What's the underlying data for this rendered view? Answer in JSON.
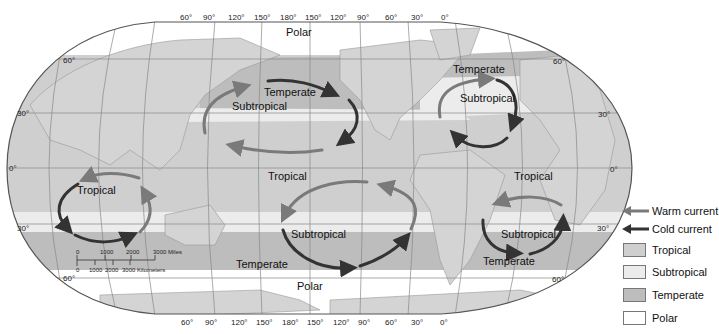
{
  "map": {
    "title": "Ocean circulation gyres and climate zones",
    "projection": "world map, Pacific-centered",
    "zone_labels": [
      {
        "id": "polar-north",
        "text": "Polar",
        "x": 327,
        "y": 11
      },
      {
        "id": "temperate-npac",
        "text": "Temperate",
        "x": 264,
        "y": 87
      },
      {
        "id": "subtropical-npac",
        "text": "Subtropical",
        "x": 232,
        "y": 101
      },
      {
        "id": "temperate-natl",
        "text": "Temperate",
        "x": 453,
        "y": 63
      },
      {
        "id": "subtropical-natl",
        "text": "Subtropical",
        "x": 459,
        "y": 92
      },
      {
        "id": "tropical-pac",
        "text": "Tropical",
        "x": 268,
        "y": 170
      },
      {
        "id": "tropical-atl",
        "text": "Tropical",
        "x": 514,
        "y": 170
      },
      {
        "id": "tropical-ind",
        "text": "Tropical",
        "x": 77,
        "y": 186
      },
      {
        "id": "subtropical-spac",
        "text": "Subtropical",
        "x": 291,
        "y": 232
      },
      {
        "id": "subtropical-satl",
        "text": "Subtropical",
        "x": 501,
        "y": 232
      },
      {
        "id": "temperate-spac",
        "text": "Temperate",
        "x": 236,
        "y": 258
      },
      {
        "id": "temperate-satl",
        "text": "Temperate",
        "x": 483,
        "y": 255
      },
      {
        "id": "polar-south",
        "text": "Polar",
        "x": 297,
        "y": 280
      }
    ],
    "lon_ticks_top": [
      "60°",
      "90°",
      "120°",
      "150°",
      "180°",
      "150°",
      "120°",
      "90°",
      "60°",
      "30°",
      "0°"
    ],
    "lon_ticks_bottom": [
      "60°",
      "90°",
      "120°",
      "150°",
      "180°",
      "150°",
      "120°",
      "90°",
      "60°",
      "30°",
      "0°"
    ],
    "lat_ticks_left": [
      {
        "text": "60°",
        "x": 63,
        "y": 56
      },
      {
        "text": "30°",
        "x": 17,
        "y": 109
      },
      {
        "text": "0°",
        "x": 9,
        "y": 167
      },
      {
        "text": "30°",
        "x": 17,
        "y": 224
      },
      {
        "text": "60°",
        "x": 63,
        "y": 274
      }
    ],
    "lat_ticks_right": [
      {
        "text": "60°",
        "x": 553,
        "y": 57
      },
      {
        "text": "30°",
        "x": 598,
        "y": 110
      },
      {
        "text": "0°",
        "x": 611,
        "y": 168
      },
      {
        "text": "30°",
        "x": 598,
        "y": 223
      },
      {
        "text": "60°",
        "x": 552,
        "y": 275
      }
    ],
    "scale_bar": {
      "miles": [
        "0",
        "1000",
        "2000",
        "3000 Miles"
      ],
      "kilometers": [
        "0",
        "1000",
        "2000",
        "3000 Kilometers"
      ]
    }
  },
  "legend": {
    "items": [
      {
        "type": "arrow",
        "label": "Warm current",
        "color": "#7a7a7a"
      },
      {
        "type": "arrow",
        "label": "Cold current",
        "color": "#333333"
      },
      {
        "type": "swatch",
        "label": "Tropical",
        "color": "#cfcfcf"
      },
      {
        "type": "swatch",
        "label": "Subtropical",
        "color": "#ececec"
      },
      {
        "type": "swatch",
        "label": "Temperate",
        "color": "#bdbdbd"
      },
      {
        "type": "swatch",
        "label": "Polar",
        "color": "#ffffff"
      }
    ]
  },
  "colors": {
    "land": "#d4d4d4",
    "tropical": "#cfcfcf",
    "subtropical": "#ececec",
    "temperate": "#bdbdbd",
    "polar": "#ffffff",
    "warm": "#7a7a7a",
    "cold": "#333333",
    "grid": "#888888"
  }
}
